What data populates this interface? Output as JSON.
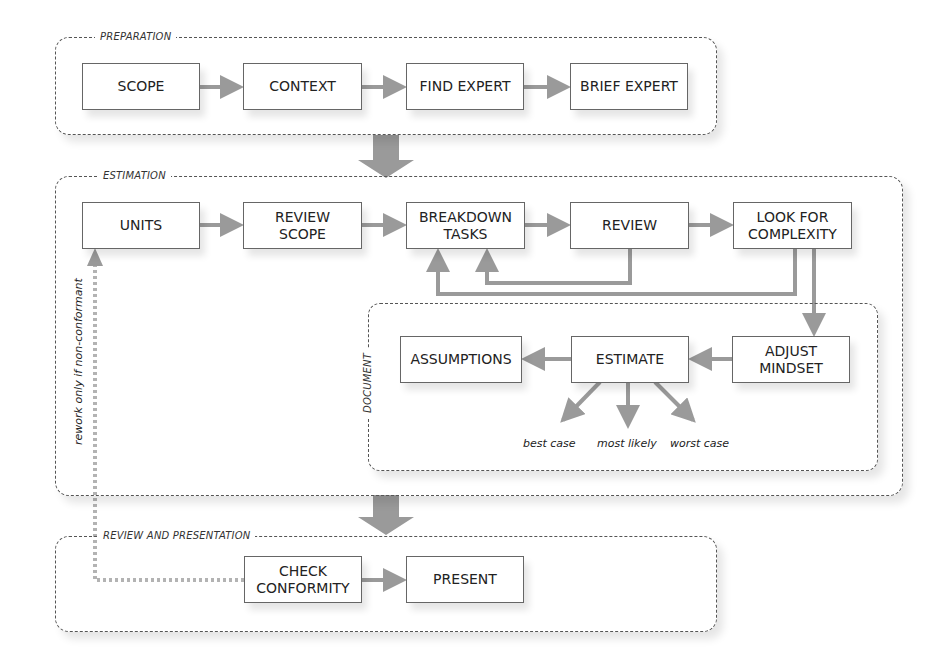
{
  "colors": {
    "arrow": "#9a9a9a",
    "border": "#555555",
    "text": "#222222",
    "background": "#ffffff"
  },
  "groups": {
    "preparation": {
      "label": "PREPARATION"
    },
    "estimation": {
      "label": "ESTIMATION"
    },
    "document": {
      "label": "DOCUMENT"
    },
    "review": {
      "label": "REVIEW AND PRESENTATION"
    }
  },
  "nodes": {
    "scope": "SCOPE",
    "context": "CONTEXT",
    "find_expert": "FIND EXPERT",
    "brief_expert": "BRIEF EXPERT",
    "units": "UNITS",
    "review_scope": "REVIEW\nSCOPE",
    "breakdown_tasks": "BREAKDOWN\nTASKS",
    "review": "REVIEW",
    "look_for_complexity": "LOOK FOR\nCOMPLEXITY",
    "assumptions": "ASSUMPTIONS",
    "estimate": "ESTIMATE",
    "adjust_mindset": "ADJUST\nMINDSET",
    "check_conformity": "CHECK\nCONFORMITY",
    "present": "PRESENT"
  },
  "cases": {
    "best": "best case",
    "likely": "most likely",
    "worst": "worst case"
  },
  "rework_label": "rework only if non-conformant",
  "edges": [
    [
      "scope",
      "context"
    ],
    [
      "context",
      "find_expert"
    ],
    [
      "find_expert",
      "brief_expert"
    ],
    [
      "preparation",
      "estimation"
    ],
    [
      "units",
      "review_scope"
    ],
    [
      "review_scope",
      "breakdown_tasks"
    ],
    [
      "breakdown_tasks",
      "review"
    ],
    [
      "review",
      "look_for_complexity"
    ],
    [
      "review",
      "breakdown_tasks"
    ],
    [
      "look_for_complexity",
      "breakdown_tasks"
    ],
    [
      "look_for_complexity",
      "adjust_mindset"
    ],
    [
      "adjust_mindset",
      "estimate"
    ],
    [
      "estimate",
      "assumptions"
    ],
    [
      "estimate",
      "best case"
    ],
    [
      "estimate",
      "most likely"
    ],
    [
      "estimate",
      "worst case"
    ],
    [
      "estimation",
      "review_and_presentation"
    ],
    [
      "check_conformity",
      "present"
    ],
    [
      "check_conformity",
      "units",
      "rework only if non-conformant"
    ]
  ]
}
